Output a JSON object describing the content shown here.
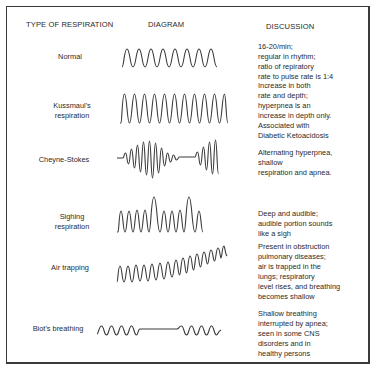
{
  "headers": {
    "type": "TYPE OF RESPIRATION",
    "diagram": "DIAGRAM",
    "discussion": "DISCUSSION"
  },
  "rows": [
    {
      "type_lines": [
        "Normal"
      ],
      "wave": "normal",
      "discussion_lines": [
        "16-20/min;",
        "regular in rhythm;",
        "ratio of repiratory",
        "rate to pulse rate is 1:4"
      ]
    },
    {
      "type_lines": [
        "Kussmaul's",
        "respiration"
      ],
      "wave": "kussmaul",
      "discussion_lines": [
        "Increase in both",
        "rate and depth;",
        "hyperpnea is an",
        "increase in depth only.",
        "Associated with",
        "Diabetic Ketoacidosis"
      ]
    },
    {
      "type_lines": [
        "Cheyne-Stokes"
      ],
      "wave": "cheyne-stokes",
      "discussion_lines": [
        "Alternating hyperpnea,",
        "shallow",
        "respiration and apnea."
      ]
    },
    {
      "type_lines": [
        "Sighing",
        "respiration"
      ],
      "wave": "sighing",
      "discussion_lines": [
        "Deep and audible;",
        "audible portion sounds",
        "like a sigh"
      ]
    },
    {
      "type_lines": [
        "Air trapping"
      ],
      "wave": "air-trapping",
      "discussion_lines": [
        "Present in obstruction",
        "pulmonary diseases;",
        "air is trapped in the",
        "lungs; respiratory",
        "level rises, and breathing",
        "becomes shallow"
      ]
    },
    {
      "type_lines": [
        "Biot's breathing"
      ],
      "wave": "biots",
      "discussion_lines": [
        "Shallow breathing",
        "interrupted by apnea;",
        "seen in some CNS",
        "disorders and in",
        "healthy persons"
      ]
    }
  ],
  "colors": {
    "ink": "#3a3a3a",
    "background": "#ffffff"
  }
}
